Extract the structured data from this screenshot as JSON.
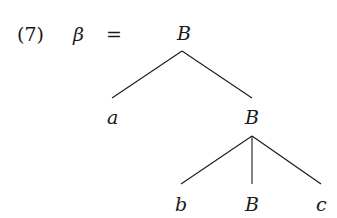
{
  "example_number": "(7)",
  "lhs_symbol": "β",
  "equals": "=",
  "tree": {
    "root": "B",
    "children": [
      {
        "label": "a"
      },
      {
        "label": "B",
        "children": [
          {
            "label": "b"
          },
          {
            "label": "B"
          },
          {
            "label": "c"
          }
        ]
      }
    ]
  },
  "colors": {
    "ink": "#1a1a1a",
    "background": "#ffffff"
  }
}
